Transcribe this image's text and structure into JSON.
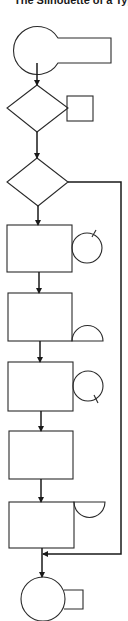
{
  "title": "The Silhouette of a Typ",
  "diagram": {
    "type": "flowchart-silhouette",
    "nodes": [
      {
        "id": "start",
        "shape": "circle-with-tab"
      },
      {
        "id": "decision-1",
        "shape": "diamond",
        "annotation": "square"
      },
      {
        "id": "decision-2",
        "shape": "diamond",
        "branch": "bypass-right"
      },
      {
        "id": "process-1",
        "shape": "rectangle",
        "annotation": "circle-with-tick"
      },
      {
        "id": "process-2",
        "shape": "rectangle",
        "annotation": "half-circle"
      },
      {
        "id": "process-3",
        "shape": "rectangle",
        "annotation": "circle-with-tick"
      },
      {
        "id": "process-4",
        "shape": "rectangle"
      },
      {
        "id": "process-5",
        "shape": "rectangle",
        "annotation": "half-circle-bowl"
      },
      {
        "id": "end",
        "shape": "circle-with-tab"
      }
    ],
    "edges": [
      [
        "start",
        "decision-1"
      ],
      [
        "decision-1",
        "decision-2"
      ],
      [
        "decision-2",
        "process-1"
      ],
      [
        "process-1",
        "process-2"
      ],
      [
        "process-2",
        "process-3"
      ],
      [
        "process-3",
        "process-4"
      ],
      [
        "process-4",
        "process-5"
      ],
      [
        "process-5",
        "end"
      ],
      [
        "decision-2",
        "end"
      ]
    ]
  }
}
